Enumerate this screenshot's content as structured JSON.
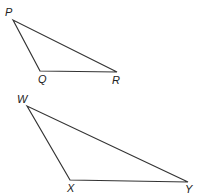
{
  "diagram": {
    "triangles": [
      {
        "name": "PQR",
        "vertices": [
          {
            "label": "P",
            "x": 13,
            "y": 20,
            "lx": 5,
            "ly": 16
          },
          {
            "label": "Q",
            "x": 40,
            "y": 71,
            "lx": 38,
            "ly": 83
          },
          {
            "label": "R",
            "x": 117,
            "y": 72,
            "lx": 112,
            "ly": 84
          }
        ]
      },
      {
        "name": "WXY",
        "vertices": [
          {
            "label": "W",
            "x": 27,
            "y": 106,
            "lx": 17,
            "ly": 103
          },
          {
            "label": "X",
            "x": 70,
            "y": 180,
            "lx": 67,
            "ly": 192
          },
          {
            "label": "Y",
            "x": 188,
            "y": 182,
            "lx": 185,
            "ly": 193
          }
        ]
      }
    ],
    "stroke_color": "#333333"
  }
}
